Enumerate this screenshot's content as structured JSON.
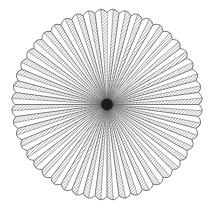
{
  "diagram": {
    "type": "radial-fan",
    "center": {
      "x": 107,
      "y": 104.5
    },
    "outer_radius": 92,
    "petal_count": 48,
    "start_angle_deg": -90,
    "colors": {
      "background": "#ffffff",
      "outline": "#444444",
      "hatch": "#555555",
      "center": "#111111"
    },
    "hatch": {
      "direction": "diagonal",
      "spacing": 2.2
    }
  }
}
